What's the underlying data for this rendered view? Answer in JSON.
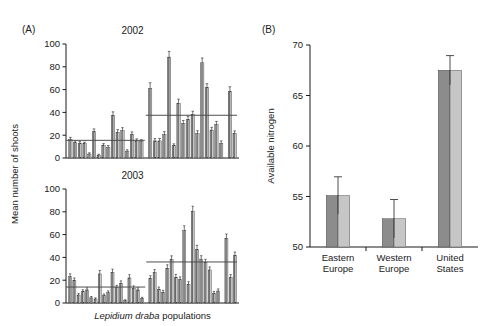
{
  "figure": {
    "panel_a": {
      "letter": "(A)",
      "ylabel": "Mean number of shoots",
      "xlabel_italic": "Lepidium draba",
      "xlabel_rest": " populations",
      "yticks": [
        0,
        20,
        40,
        60,
        80,
        100
      ],
      "subpanels": [
        {
          "title": "2002"
        },
        {
          "title": "2003"
        }
      ]
    },
    "panel_b": {
      "letter": "(B)",
      "ylabel": "Available nitrogen",
      "yticks": [
        50,
        55,
        60,
        65,
        70
      ]
    }
  },
  "colors": {
    "bar_dark": "#8c8c8c",
    "bar_light": "#c6c6c6",
    "axis": "#1a1a1a",
    "mean_line": "#4d4d4d",
    "error": "#3a3a3a",
    "background": "#ffffff"
  },
  "chart_data": [
    {
      "type": "bar",
      "title": "2002",
      "panel": "A",
      "xlabel": "Lepidium draba populations",
      "ylabel": "Mean number of shoots",
      "ylim": [
        0,
        100
      ],
      "grid": false,
      "legend": "none",
      "group_mean_lines": [
        {
          "group": "europe",
          "value": 15.5
        },
        {
          "group": "united-states",
          "value": 37.5
        }
      ],
      "groups": [
        {
          "name": "Europe",
          "categories": [
            "E1",
            "E2",
            "E3",
            "E4",
            "E5",
            "E6",
            "E7",
            "E8",
            "E9",
            "E10",
            "E11",
            "E12",
            "E13",
            "E14",
            "E15",
            "E16"
          ],
          "values": [
            16.5,
            13.5,
            13.0,
            12.5,
            3.5,
            23.0,
            2.5,
            11.0,
            9.5,
            37.5,
            22.5,
            24.0,
            6.0,
            20.5,
            15.0,
            14.5
          ],
          "errors": [
            1.6,
            1.4,
            1.4,
            1.4,
            1.0,
            2.5,
            0.8,
            1.6,
            1.4,
            3.0,
            2.4,
            2.6,
            1.2,
            2.4,
            1.8,
            1.6
          ]
        },
        {
          "name": "United States",
          "categories": [
            "U1",
            "U2",
            "U3",
            "U4",
            "U5",
            "U6",
            "U7",
            "U8",
            "U9",
            "U10",
            "U11",
            "U12",
            "U13",
            "U14",
            "U15",
            "U16"
          ],
          "values": [
            61.0,
            15.0,
            15.0,
            20.5,
            88.5,
            11.0,
            48.0,
            30.5,
            34.0,
            38.0,
            21.5,
            83.5,
            62.0,
            24.5,
            29.5,
            13.0
          ],
          "errors": [
            5.0,
            2.0,
            2.2,
            2.6,
            5.0,
            1.4,
            3.6,
            2.4,
            2.6,
            3.0,
            2.4,
            4.2,
            3.2,
            2.4,
            2.6,
            2.0
          ]
        },
        {
          "name": "United States (cont.)",
          "categories": [
            "U17",
            "U18"
          ],
          "values": [
            58.5,
            21.5
          ],
          "errors": [
            4.0,
            2.2
          ]
        }
      ]
    },
    {
      "type": "bar",
      "title": "2003",
      "panel": "A",
      "xlabel": "Lepidium draba populations",
      "ylabel": "Mean number of shoots",
      "ylim": [
        0,
        100
      ],
      "grid": false,
      "legend": "none",
      "group_mean_lines": [
        {
          "group": "europe",
          "value": 14.0
        },
        {
          "group": "united-states",
          "value": 36.0
        }
      ],
      "groups": [
        {
          "name": "Europe",
          "categories": [
            "E1",
            "E2",
            "E3",
            "E4",
            "E5",
            "E6",
            "E7",
            "E8",
            "E9",
            "E10",
            "E11",
            "E12",
            "E13",
            "E14",
            "E15",
            "E16",
            "E17",
            "E18"
          ],
          "values": [
            23.0,
            19.5,
            7.0,
            10.0,
            11.5,
            4.5,
            3.5,
            25.5,
            6.5,
            9.0,
            26.5,
            13.5,
            17.0,
            2.0,
            22.0,
            13.0,
            11.5,
            4.0
          ],
          "errors": [
            2.6,
            2.4,
            1.4,
            1.6,
            1.8,
            1.2,
            1.0,
            3.0,
            1.4,
            1.6,
            3.2,
            2.0,
            2.4,
            0.8,
            2.8,
            2.0,
            1.8,
            1.0
          ]
        },
        {
          "name": "United States",
          "categories": [
            "U1",
            "U2",
            "U3",
            "U4",
            "U5",
            "U6",
            "U7",
            "U8",
            "U9",
            "U10",
            "U11",
            "U12",
            "U13",
            "U14",
            "U15",
            "U16",
            "U17"
          ],
          "values": [
            21.5,
            26.5,
            12.0,
            9.5,
            30.5,
            38.0,
            22.5,
            20.5,
            63.5,
            16.5,
            80.5,
            47.0,
            38.5,
            35.5,
            29.0,
            8.5,
            10.5
          ],
          "errors": [
            2.4,
            2.8,
            2.0,
            1.6,
            3.0,
            3.4,
            2.6,
            2.4,
            4.2,
            2.2,
            4.4,
            3.6,
            3.0,
            2.8,
            2.6,
            1.6,
            1.8
          ]
        },
        {
          "name": "United States (cont.)",
          "categories": [
            "U18",
            "U19",
            "U20"
          ],
          "values": [
            56.5,
            22.5,
            41.5
          ],
          "errors": [
            4.0,
            2.4,
            3.2
          ]
        }
      ]
    },
    {
      "type": "bar",
      "panel": "B",
      "title": "",
      "categories": [
        "Eastern\nEurope",
        "Western\nEurope",
        "United\nStates"
      ],
      "category_lines": [
        [
          "Eastern",
          "Europe"
        ],
        [
          "Western",
          "Europe"
        ],
        [
          "United",
          "States"
        ]
      ],
      "values": [
        55.1,
        52.8,
        67.5
      ],
      "errors": [
        1.85,
        1.9,
        1.45
      ],
      "xlabel": "",
      "ylabel": "Available nitrogen",
      "ylim": [
        50,
        70
      ],
      "grid": false,
      "legend": "none"
    }
  ]
}
